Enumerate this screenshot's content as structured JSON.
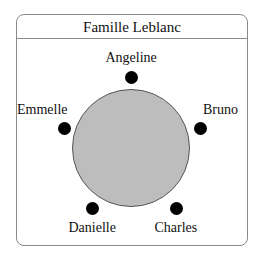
{
  "title": "Famille Leblanc",
  "table": {
    "shape": "circle",
    "color": "#bdbdbd",
    "cx": 131,
    "cy": 148,
    "diameter": 118
  },
  "seats": [
    {
      "name": "Angeline",
      "dot": {
        "x": 131,
        "y": 77
      },
      "label": {
        "x": 131,
        "y": 58,
        "align": "center"
      }
    },
    {
      "name": "Bruno",
      "dot": {
        "x": 200,
        "y": 128
      },
      "label": {
        "x": 203,
        "y": 110,
        "align": "left"
      }
    },
    {
      "name": "Charles",
      "dot": {
        "x": 176,
        "y": 208
      },
      "label": {
        "x": 176,
        "y": 228,
        "align": "center"
      }
    },
    {
      "name": "Danielle",
      "dot": {
        "x": 92,
        "y": 208
      },
      "label": {
        "x": 92,
        "y": 228,
        "align": "center"
      }
    },
    {
      "name": "Emmelle",
      "dot": {
        "x": 64,
        "y": 128
      },
      "label": {
        "x": 68,
        "y": 110,
        "align": "right"
      }
    }
  ]
}
